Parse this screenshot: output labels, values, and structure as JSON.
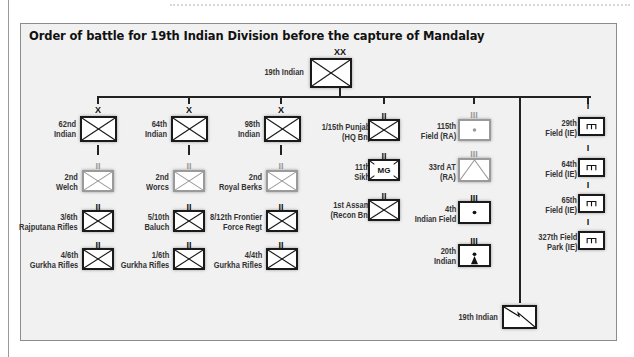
{
  "page": {
    "header_text_clipped": ""
  },
  "diagram": {
    "title": "Order of battle for 19th Indian Division before the capture of Mandalay",
    "division": {
      "name": "19th Indian",
      "echelon": "XX",
      "type": "infantry"
    },
    "brigades": [
      {
        "name": "62nd\nIndian",
        "echelon": "X",
        "type": "infantry",
        "battalions": [
          {
            "name": "2nd\nWelch",
            "echelon": "II",
            "type": "infantry",
            "style": "grey"
          },
          {
            "name": "3/6th\nRajputana Rifles",
            "echelon": "II",
            "type": "infantry"
          },
          {
            "name": "4/6th\nGurkha Rifles",
            "echelon": "II",
            "type": "infantry"
          }
        ]
      },
      {
        "name": "64th\nIndian",
        "echelon": "X",
        "type": "infantry",
        "battalions": [
          {
            "name": "2nd\nWorcs",
            "echelon": "II",
            "type": "infantry",
            "style": "grey"
          },
          {
            "name": "5/10th\nBaluch",
            "echelon": "II",
            "type": "infantry"
          },
          {
            "name": "1/6th\nGurkha Rifles",
            "echelon": "II",
            "type": "infantry"
          }
        ]
      },
      {
        "name": "98th\nIndian",
        "echelon": "X",
        "type": "infantry",
        "battalions": [
          {
            "name": "2nd\nRoyal Berks",
            "echelon": "II",
            "type": "infantry",
            "style": "grey"
          },
          {
            "name": "8/12th Frontier\nForce Regt",
            "echelon": "II",
            "type": "infantry"
          },
          {
            "name": "4/4th\nGurkha Rifles",
            "echelon": "II",
            "type": "infantry"
          }
        ]
      }
    ],
    "divisional_troops": [
      {
        "name": "1/15th Punjab\n(HQ Bn)",
        "echelon": "II",
        "type": "infantry"
      },
      {
        "name": "11th\nSikh",
        "echelon": "II",
        "type": "machine-gun",
        "symbol_text": "MG"
      },
      {
        "name": "1st Assam\n(Recon Bn)",
        "echelon": "II",
        "type": "infantry"
      }
    ],
    "artillery": [
      {
        "name": "115th\nField (RA)",
        "echelon": "III",
        "type": "field-artillery",
        "style": "grey"
      },
      {
        "name": "33rd AT\n(RA)",
        "echelon": "III",
        "type": "anti-tank",
        "style": "grey"
      },
      {
        "name": "4th\nIndian Field",
        "echelon": "III",
        "type": "field-artillery"
      },
      {
        "name": "20th\nIndian",
        "echelon": "III",
        "type": "mountain-artillery"
      }
    ],
    "engineers": [
      {
        "name": "29th\nField (IE)",
        "echelon": "I",
        "type": "engineer",
        "symbol_text": "m"
      },
      {
        "name": "64th\nField (IE)",
        "echelon": "I",
        "type": "engineer",
        "symbol_text": "m"
      },
      {
        "name": "65th\nField (IE)",
        "echelon": "I",
        "type": "engineer",
        "symbol_text": "m"
      },
      {
        "name": "327th Field\nPark (IE)",
        "echelon": "I",
        "type": "engineer",
        "symbol_text": "m"
      }
    ],
    "signals": {
      "name": "19th Indian",
      "type": "signals"
    },
    "colors": {
      "line": "#222222",
      "panel_bg": "#f1f1f1",
      "unit_border": "#1a1a1a",
      "grey_unit": "#9a9a9a"
    }
  }
}
